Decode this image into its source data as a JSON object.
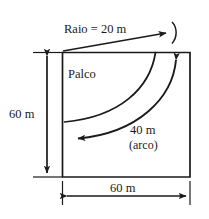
{
  "figure": {
    "type": "geometry-diagram",
    "colors": {
      "stroke": "#1a1a1a",
      "text": "#1a1a1a",
      "background": "#ffffff"
    },
    "shape": {
      "name": "square",
      "width_label": "60 m",
      "height_label": "60 m",
      "interior_label": "Palco"
    },
    "labels": {
      "radius": "Raio = 20 m",
      "arc_value": "40 m",
      "arc_unit": "(arco)",
      "height": "60 m",
      "width": "60 m",
      "interior": "Palco"
    },
    "measurements": [
      {
        "name": "raio",
        "text": "Raio = 20 m",
        "value": 20,
        "unit": "m"
      },
      {
        "name": "arco",
        "text": "40 m",
        "value": 40,
        "unit": "m",
        "note": "(arco)"
      },
      {
        "name": "altura",
        "text": "60 m",
        "value": 60,
        "unit": "m"
      },
      {
        "name": "largura",
        "text": "60 m",
        "value": 60,
        "unit": "m"
      }
    ]
  }
}
